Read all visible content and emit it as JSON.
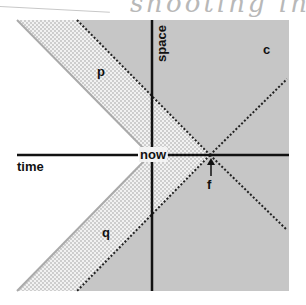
{
  "header": {
    "handwritten_fragment": "shooting in sc"
  },
  "diagram": {
    "axes": {
      "horizontal_label": "time",
      "vertical_label": "space",
      "origin_label": "now"
    },
    "regions": [
      {
        "id": "p",
        "label": "p",
        "fill": "dotted"
      },
      {
        "id": "q",
        "label": "q",
        "fill": "dotted"
      },
      {
        "id": "c",
        "label": "c",
        "fill": "gray"
      }
    ],
    "point": {
      "label": "f"
    },
    "colors": {
      "gray_region": "#c6c6c6",
      "dot_pattern": "#bdbdbd",
      "axis": "#111111",
      "solid_edge": "#aaaaaa"
    }
  }
}
